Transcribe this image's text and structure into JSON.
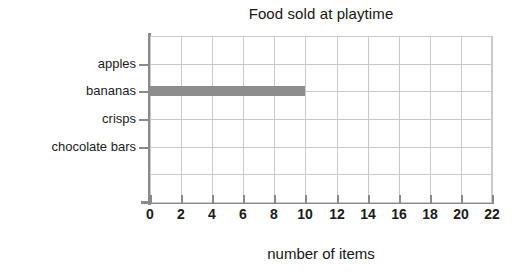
{
  "chart_data": {
    "type": "bar",
    "orientation": "horizontal",
    "title": "Food sold at playtime",
    "xlabel": "number of items",
    "ylabel": "",
    "categories": [
      "apples",
      "bananas",
      "crisps",
      "chocolate bars"
    ],
    "values": [
      0,
      10,
      0,
      0
    ],
    "xlim": [
      0,
      22
    ],
    "xticks": [
      0,
      2,
      4,
      6,
      8,
      10,
      12,
      14,
      16,
      18,
      20,
      22
    ],
    "xtick_labels": [
      "0",
      "2",
      "4",
      "6",
      "8",
      "10",
      "12",
      "14",
      "16",
      "18",
      "20",
      "22"
    ],
    "grid": true,
    "grid_axis": "both",
    "legend": false,
    "legend_position": "none",
    "bar_color": "#8d8d8d",
    "grid_color": "#c9c9c9",
    "axis_color": "#8a8a8a",
    "text_color": "#1b1b1b",
    "background": "#ffffff"
  }
}
